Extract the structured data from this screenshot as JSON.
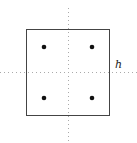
{
  "diagram": {
    "axis_label": "h",
    "square": {
      "x": 26,
      "y": 29,
      "width": 84,
      "height": 87
    },
    "dots": [
      {
        "x": 44,
        "y": 47
      },
      {
        "x": 92,
        "y": 47
      },
      {
        "x": 44,
        "y": 98
      },
      {
        "x": 92,
        "y": 98
      }
    ],
    "colors": {
      "stroke": "#444444",
      "dot": "#111111",
      "axis": "#aaaaaa"
    }
  }
}
